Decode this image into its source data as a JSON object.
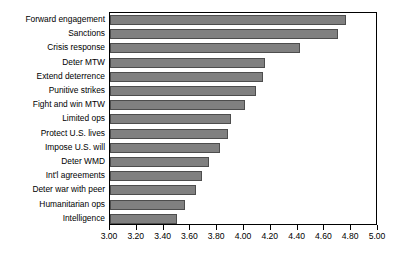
{
  "chart_data": {
    "type": "bar",
    "orientation": "horizontal",
    "title": "",
    "subtitle": "",
    "xlabel": "",
    "ylabel": "",
    "xlim": [
      3.0,
      5.0
    ],
    "xtick_step": 0.2,
    "grid": false,
    "legend": false,
    "bar_color": "#808080",
    "bar_edge_color": "#4D4D4D",
    "axis_color": "#000000",
    "categories": [
      "Forward engagement",
      "Sanctions",
      "Crisis response",
      "Deter MTW",
      "Extend deterrence",
      "Punitive strikes",
      "Fight and win MTW",
      "Limited ops",
      "Protect U.S. lives",
      "Impose U.S. will",
      "Deter WMD",
      "Int'l agreements",
      "Deter war with peer",
      "Humanitarian ops",
      "Intelligence"
    ],
    "values": [
      4.76,
      4.7,
      4.42,
      4.16,
      4.14,
      4.09,
      4.01,
      3.9,
      3.88,
      3.82,
      3.74,
      3.69,
      3.64,
      3.56,
      3.5
    ],
    "xticks": [
      3.0,
      3.2,
      3.4,
      3.6,
      3.8,
      4.0,
      4.2,
      4.4,
      4.6,
      4.8,
      5.0
    ],
    "xtick_labels": [
      "3.00",
      "3.20",
      "3.40",
      "3.60",
      "3.80",
      "4.00",
      "4.20",
      "4.40",
      "4.60",
      "4.80",
      "5.00"
    ]
  }
}
